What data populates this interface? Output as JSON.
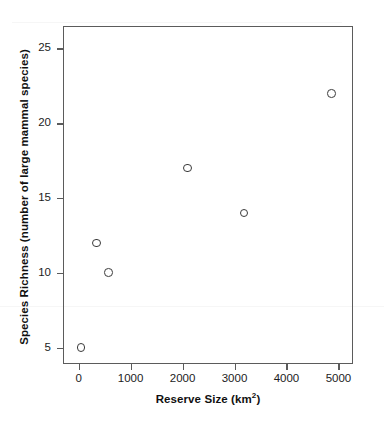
{
  "chart_data": {
    "type": "scatter",
    "title": "",
    "xlabel": "Reserve Size (km2)",
    "xlabel_base": "Reserve Size (km",
    "xlabel_exp": "2",
    "xlabel_tail": ")",
    "ylabel": "Species Richness (number of large mammal species)",
    "xlim": [
      -300,
      5280
    ],
    "ylim": [
      3.9,
      26.5
    ],
    "xticks": [
      0,
      1000,
      2000,
      3000,
      4000,
      5000
    ],
    "xtick_labels": [
      "0",
      "1000",
      "2000",
      "3000",
      "4000",
      "5000"
    ],
    "yticks": [
      5,
      10,
      15,
      20,
      25
    ],
    "ytick_labels": [
      "5",
      "10",
      "15",
      "20",
      "25"
    ],
    "grid": false,
    "legend": false,
    "marker": "open-circle",
    "marker_color": "#3a3a3a",
    "frame_color": "#5b5b5b",
    "points": [
      {
        "x": 50,
        "y": 5,
        "label": "50 km2, 5 species"
      },
      {
        "x": 350,
        "y": 12,
        "label": "350 km2, 12 species"
      },
      {
        "x": 580,
        "y": 10,
        "label": "580 km2, 10 species"
      },
      {
        "x": 2100,
        "y": 17,
        "label": "2100 km2, 17 species"
      },
      {
        "x": 3180,
        "y": 14,
        "label": "3180 km2, 14 species"
      },
      {
        "x": 4870,
        "y": 22,
        "label": "4870 km2, 22 species"
      }
    ]
  }
}
